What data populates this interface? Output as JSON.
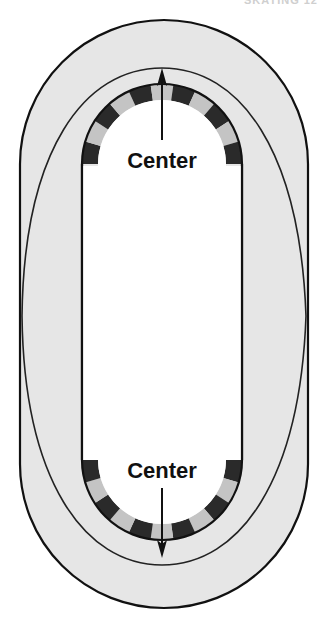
{
  "caption": "SKATING 12",
  "labels": {
    "top_center": "Center",
    "bottom_center": "Center"
  },
  "colors": {
    "track": "#e6e6e6",
    "outline": "#111111",
    "segment_dark": "#2a2a2a",
    "segment_light": "#c4c4c4",
    "infield": "#ffffff"
  },
  "geometry": {
    "outer": {
      "x": 20,
      "y": 20,
      "width": 288,
      "height": 588,
      "radius": 144
    },
    "inner": {
      "x": 82,
      "y": 84,
      "width": 160,
      "height": 456,
      "radius": 80
    },
    "top_arc_center": {
      "x": 162,
      "y": 164
    },
    "bottom_arc_center": {
      "x": 162,
      "y": 460
    },
    "band_thickness": 16,
    "segments_per_arc": 11
  }
}
